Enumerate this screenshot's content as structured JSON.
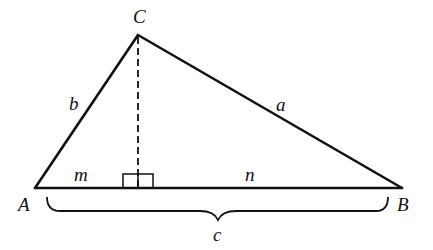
{
  "diagram": {
    "type": "geometry",
    "colors": {
      "stroke": "#111111",
      "background": "#ffffff"
    },
    "vertices": {
      "A": {
        "label": "A",
        "x": 35,
        "y": 188
      },
      "B": {
        "label": "B",
        "x": 402,
        "y": 188
      },
      "C": {
        "label": "C",
        "x": 138,
        "y": 35
      }
    },
    "altitude_foot": {
      "x": 138,
      "y": 188
    },
    "sides": {
      "a": {
        "label": "a",
        "from": "C",
        "to": "B"
      },
      "b": {
        "label": "b",
        "from": "A",
        "to": "C"
      },
      "c": {
        "label": "c",
        "from": "A",
        "to": "B"
      }
    },
    "segments": {
      "m": {
        "label": "m"
      },
      "n": {
        "label": "n"
      }
    },
    "labels": {
      "A": "A",
      "B": "B",
      "C": "C",
      "a": "a",
      "b": "b",
      "c": "c",
      "m": "m",
      "n": "n"
    }
  }
}
